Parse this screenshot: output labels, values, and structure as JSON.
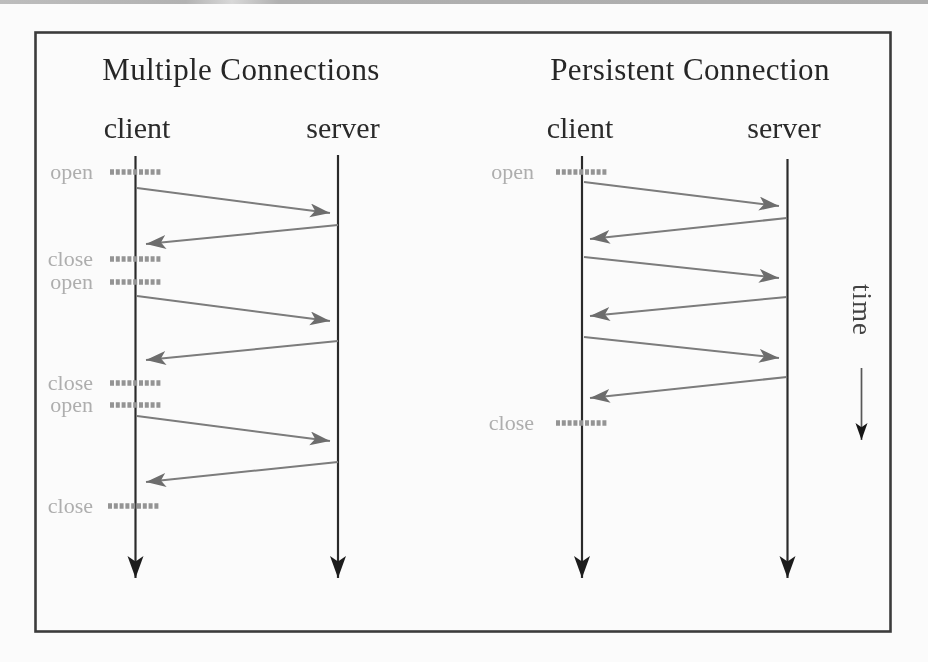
{
  "figure": {
    "time_axis_label": "time",
    "colors": {
      "message_arrow_gray": "#7b7b7b",
      "arrowhead_gray": "#6d6d6d",
      "tick_gray": "#949494",
      "event_label_gray": "#aeaeae",
      "timeline_black": "#2c2c2c",
      "frame_border": "#3b3b3b"
    },
    "panels": {
      "left": {
        "title": "Multiple Connections",
        "client_label": "client",
        "server_label": "server",
        "markers": [
          {
            "label": "open"
          },
          {
            "label": "close"
          },
          {
            "label": "open"
          },
          {
            "label": "close"
          },
          {
            "label": "open"
          },
          {
            "label": "close"
          }
        ],
        "request_response_pairs": 3
      },
      "right": {
        "title": "Persistent Connection",
        "client_label": "client",
        "server_label": "server",
        "markers": [
          {
            "label": "open"
          },
          {
            "label": "close"
          }
        ],
        "request_response_pairs": 3
      }
    }
  }
}
